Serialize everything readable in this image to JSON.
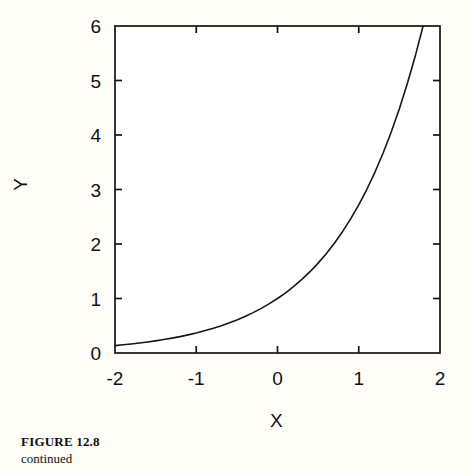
{
  "caption": {
    "title": "FIGURE 12.8",
    "subtitle": "continued"
  },
  "axis_titles": {
    "x": "X",
    "y": "Y"
  },
  "colors": {
    "page_background": "#fefdf8",
    "plot_background": "#ffffff",
    "axis": "#15130f",
    "curve": "#1a1713",
    "text": "#111111"
  },
  "chart_data": {
    "type": "line",
    "title": "",
    "subtitle": "",
    "xlabel": "X",
    "ylabel": "Y",
    "xlim": [
      -2,
      2
    ],
    "ylim": [
      0,
      6
    ],
    "xticks": [
      -2,
      -1,
      0,
      1,
      2
    ],
    "yticks": [
      0,
      1,
      2,
      3,
      4,
      5,
      6
    ],
    "xtick_labels": [
      "-2",
      "-1",
      "0",
      "1",
      "2"
    ],
    "ytick_labels": [
      "0",
      "1",
      "2",
      "3",
      "4",
      "5",
      "6"
    ],
    "grid": false,
    "legend": null,
    "tick_direction": "in",
    "frame": "full-box",
    "series": [
      {
        "name": "y = exp(x)",
        "x": [
          -2.0,
          -1.9,
          -1.8,
          -1.7,
          -1.6,
          -1.5,
          -1.4,
          -1.3,
          -1.2,
          -1.1,
          -1.0,
          -0.9,
          -0.8,
          -0.7,
          -0.6,
          -0.5,
          -0.4,
          -0.3,
          -0.2,
          -0.1,
          0.0,
          0.1,
          0.2,
          0.3,
          0.4,
          0.5,
          0.6,
          0.7,
          0.8,
          0.9,
          1.0,
          1.1,
          1.2,
          1.3,
          1.4,
          1.5,
          1.6,
          1.7,
          1.7918
        ],
        "values": [
          0.135,
          0.15,
          0.165,
          0.183,
          0.202,
          0.223,
          0.247,
          0.273,
          0.301,
          0.333,
          0.368,
          0.407,
          0.449,
          0.497,
          0.549,
          0.607,
          0.67,
          0.741,
          0.819,
          0.905,
          1.0,
          1.105,
          1.221,
          1.35,
          1.492,
          1.649,
          1.822,
          2.014,
          2.226,
          2.46,
          2.718,
          3.004,
          3.32,
          3.669,
          4.055,
          4.482,
          4.953,
          5.474,
          6.0
        ]
      }
    ],
    "annotations": []
  }
}
